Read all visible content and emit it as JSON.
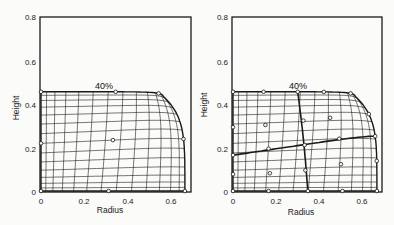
{
  "panels": [
    {
      "id": "left",
      "annotation": "40%",
      "xlabel": "Radius",
      "ylabel": "Height",
      "xticks": [
        "0",
        "0.2",
        "0.4",
        "0.6"
      ],
      "yticks": [
        "0",
        "0.2",
        "0.4",
        "0.6",
        "0.8"
      ],
      "blocks": 1
    },
    {
      "id": "right",
      "annotation": "40%",
      "xlabel": "Radius",
      "ylabel": "Height",
      "xticks": [
        "0",
        "0.2",
        "0.4",
        "0.6"
      ],
      "yticks": [
        "0",
        "0.2",
        "0.4",
        "0.6",
        "0.8"
      ],
      "blocks": 4
    }
  ],
  "colors": {
    "ink": "#1a1a1a",
    "background": "#fbfbf9"
  }
}
